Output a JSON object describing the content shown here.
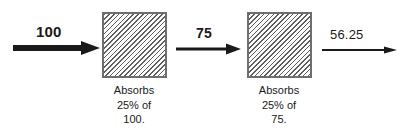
{
  "diagram": {
    "colors": {
      "stroke": "#1a1a1a",
      "box_border": "#6e6e6e",
      "box_hatch": "#5d5d5d",
      "background": "#ffffff"
    },
    "arrows": [
      {
        "name": "input-arrow",
        "label": "100",
        "weight": "thick"
      },
      {
        "name": "intermediate-arrow",
        "label": "75",
        "weight": "medium"
      },
      {
        "name": "output-arrow",
        "label": "56.25",
        "weight": "thin"
      }
    ],
    "absorbers": [
      {
        "name": "first-absorber",
        "caption": {
          "line1": "Absorbs",
          "line2": "25% of",
          "line3": "100."
        }
      },
      {
        "name": "second-absorber",
        "caption": {
          "line1": "Absorbs",
          "line2": "25% of",
          "line3": "75."
        }
      }
    ]
  }
}
